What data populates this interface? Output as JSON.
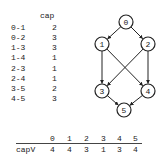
{
  "edge_table": {
    "header": "cap",
    "rows": [
      {
        "edge": "0-1",
        "cap": "2"
      },
      {
        "edge": "0-2",
        "cap": "3"
      },
      {
        "edge": "1-3",
        "cap": "3"
      },
      {
        "edge": "1-4",
        "cap": "1"
      },
      {
        "edge": "2-3",
        "cap": "1"
      },
      {
        "edge": "2-4",
        "cap": "1"
      },
      {
        "edge": "3-5",
        "cap": "2"
      },
      {
        "edge": "4-5",
        "cap": "3"
      }
    ]
  },
  "graph": {
    "nodes": [
      {
        "id": "0",
        "x": 126,
        "y": 22
      },
      {
        "id": "1",
        "x": 102,
        "y": 44
      },
      {
        "id": "2",
        "x": 148,
        "y": 44
      },
      {
        "id": "3",
        "x": 102,
        "y": 91
      },
      {
        "id": "4",
        "x": 148,
        "y": 91
      },
      {
        "id": "5",
        "x": 124,
        "y": 110
      }
    ],
    "edges": [
      [
        "0",
        "1"
      ],
      [
        "0",
        "2"
      ],
      [
        "1",
        "3"
      ],
      [
        "1",
        "4"
      ],
      [
        "2",
        "3"
      ],
      [
        "2",
        "4"
      ],
      [
        "3",
        "5"
      ],
      [
        "4",
        "5"
      ]
    ]
  },
  "vertex_table": {
    "columns": [
      "0",
      "1",
      "2",
      "3",
      "4",
      "5"
    ],
    "row_label": "capV",
    "values": [
      "4",
      "4",
      "3",
      "1",
      "3",
      "4"
    ]
  }
}
